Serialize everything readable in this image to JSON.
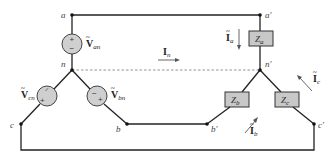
{
  "diagram": {
    "nodes": {
      "a": "a",
      "a_prime": "a′",
      "n": "n",
      "n_prime": "n′",
      "b": "b",
      "b_prime": "b′",
      "c": "c",
      "c_prime": "c′"
    },
    "sources": {
      "van": {
        "symbol": "V",
        "sub": "an",
        "polarity": "+ top"
      },
      "vbn": {
        "symbol": "V",
        "sub": "bn",
        "polarity": "+ bottom-right"
      },
      "vcn": {
        "symbol": "V",
        "sub": "cn",
        "polarity": "+ bottom-left"
      }
    },
    "impedances": {
      "za": {
        "symbol": "Z",
        "sub": "a"
      },
      "zb": {
        "symbol": "Z",
        "sub": "b"
      },
      "zc": {
        "symbol": "Z",
        "sub": "c"
      }
    },
    "currents": {
      "ia": {
        "symbol": "I",
        "sub": "a",
        "direction": "down"
      },
      "ib": {
        "symbol": "I",
        "sub": "b",
        "direction": "up-right"
      },
      "ic": {
        "symbol": "I",
        "sub": "c",
        "direction": "up-left"
      },
      "in": {
        "symbol": "I",
        "sub": "n",
        "direction": "right"
      }
    },
    "signs": {
      "plus": "+",
      "minus": "−"
    },
    "colors": {
      "wire": "#222222",
      "neutral": "#888888",
      "source_fill": "#cfcfcf",
      "impedance_fill": "#c8c8c8"
    }
  }
}
